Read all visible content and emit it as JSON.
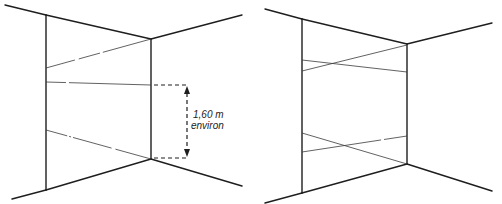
{
  "figure": {
    "panels": [
      {
        "id": "left",
        "description": "Room corner with laser lines on left wall, dimension annotation",
        "annotation": {
          "line1": "1,60 m",
          "line2": "environ"
        }
      },
      {
        "id": "right",
        "description": "Room corner with crossing laser lines on left wall"
      }
    ]
  }
}
